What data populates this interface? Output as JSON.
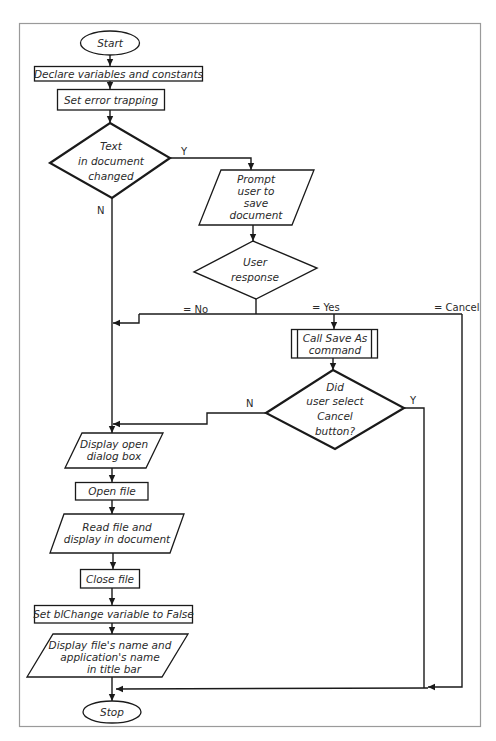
{
  "flowchart": {
    "start": "Start",
    "stop": "Stop",
    "declare": "Declare variables and constants",
    "error_trapping": "Set error trapping",
    "decision_changed": [
      "Text",
      "in document",
      "changed"
    ],
    "decision_changed_yes": "Y",
    "decision_changed_no": "N",
    "prompt": [
      "Prompt",
      "user to",
      "save",
      "document"
    ],
    "decision_response": [
      "User",
      "response"
    ],
    "response_no": "= No",
    "response_yes": "= Yes",
    "response_cancel": "= Cancel",
    "save_as": [
      "Call Save As",
      "command"
    ],
    "decision_cancel": [
      "Did",
      "user select",
      "Cancel",
      "button?"
    ],
    "decision_cancel_no": "N",
    "decision_cancel_yes": "Y",
    "display_dialog": [
      "Display open",
      "dialog box"
    ],
    "open_file": "Open file",
    "read_file": [
      "Read file and",
      "display in document"
    ],
    "close_file": "Close file",
    "set_blchange": "Set blChange variable to False",
    "display_title": [
      "Display file's name and",
      "application's name",
      "in title bar"
    ]
  }
}
